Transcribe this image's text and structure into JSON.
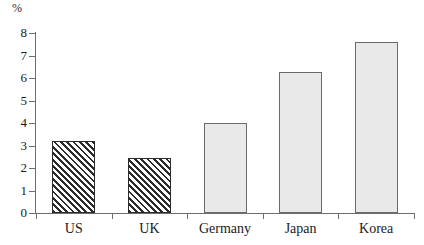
{
  "chart_data": {
    "type": "bar",
    "title": "",
    "xlabel": "",
    "ylabel": "%",
    "unit_label": "%",
    "categories": [
      "US",
      "UK",
      "Germany",
      "Japan",
      "Korea"
    ],
    "values": [
      3.2,
      2.45,
      4.0,
      6.25,
      7.6
    ],
    "ylim": [
      0,
      8
    ],
    "ytick_labels": [
      "0",
      "1",
      "2",
      "3",
      "4",
      "5",
      "6",
      "7",
      "8"
    ],
    "ytick_values": [
      0,
      1,
      2,
      3,
      4,
      5,
      6,
      7,
      8
    ],
    "grid": false,
    "legend": false,
    "legend_position": "none",
    "series": [
      {
        "name": "Percentage",
        "values": [
          3.2,
          2.45,
          4.0,
          6.25,
          7.6
        ]
      }
    ],
    "bar_styles": [
      "hatched",
      "hatched",
      "solid",
      "solid",
      "solid"
    ],
    "colors": {
      "hatch_line": "#2b2b2b",
      "hatch_background": "#ffffff",
      "solid_fill": "#e9e9e9",
      "solid_border": "#6a6a6a",
      "axis": "#6e6e6e",
      "text": "#1a1a1a",
      "page_background": "#ffffff"
    }
  },
  "axes": {
    "y_unit": "%",
    "y_min": 0,
    "y_max": 8
  }
}
